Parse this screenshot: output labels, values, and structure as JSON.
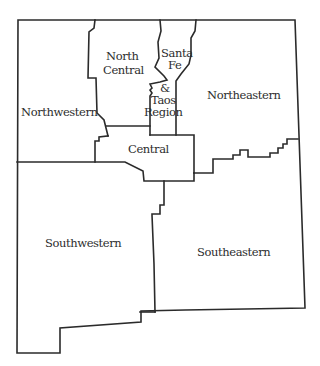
{
  "map": {
    "title": "",
    "line_color": "#2b2b2b",
    "background": "#ffffff",
    "text_color": "#2d2d2d",
    "regions": [
      {
        "id": "northwestern",
        "label_lines": [
          "Northwestern"
        ]
      },
      {
        "id": "north-central",
        "label_lines": [
          "North",
          "Central"
        ]
      },
      {
        "id": "santa-fe-taos",
        "label_lines": [
          "Santa",
          "Fe",
          "&",
          "Taos",
          "Region"
        ]
      },
      {
        "id": "northeastern",
        "label_lines": [
          "Northeastern"
        ]
      },
      {
        "id": "central",
        "label_lines": [
          "Central"
        ]
      },
      {
        "id": "southwestern",
        "label_lines": [
          "Southwestern"
        ]
      },
      {
        "id": "southeastern",
        "label_lines": [
          "Southeastern"
        ]
      }
    ]
  }
}
